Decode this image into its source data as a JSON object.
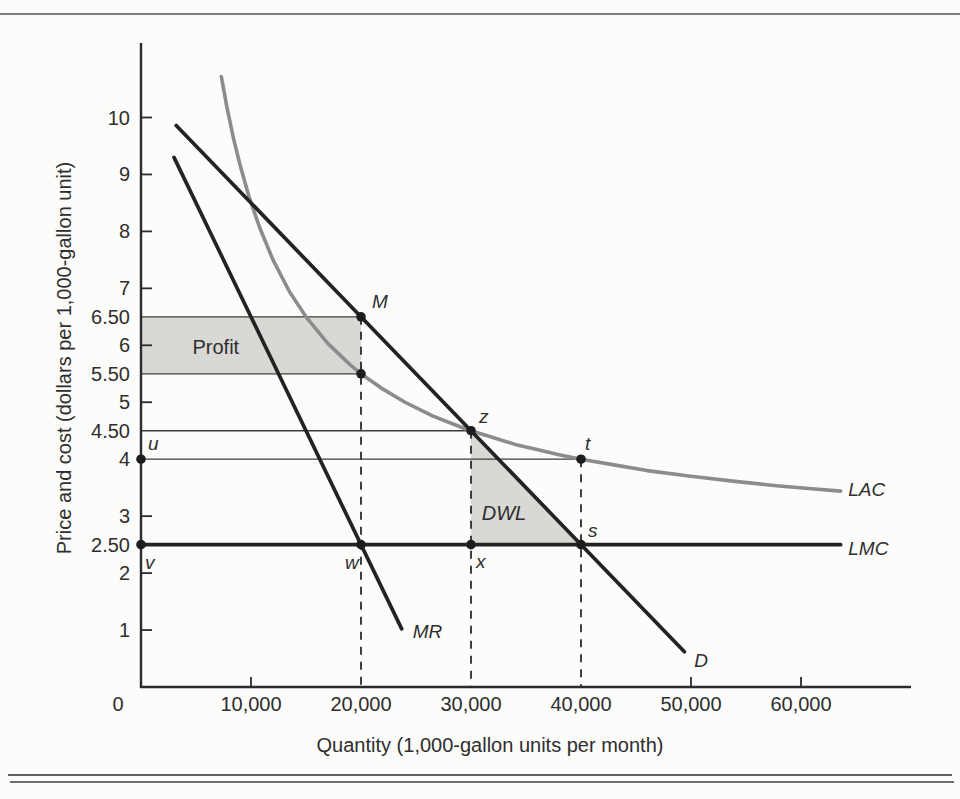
{
  "figure": {
    "description": "Monopoly profit and deadweight loss diagram"
  },
  "chart_data": {
    "type": "line",
    "title": "",
    "xlabel": "Quantity (1,000-gallon units per month)",
    "ylabel": "Price and cost (dollars per 1,000-gallon unit)",
    "xlim": [
      0,
      70000
    ],
    "ylim": [
      0,
      11.3
    ],
    "grid": false,
    "colors": {
      "ink": "#232323",
      "lac_gray": "#8c8c8c",
      "shade": "#d8d8d4",
      "thin_line": "#3c3c3c",
      "text": "#2e2e2e"
    },
    "x_ticks": [
      {
        "value": 0,
        "label": "0",
        "mark": false,
        "dx": -23
      },
      {
        "value": 10000,
        "label": "10,000",
        "mark": true,
        "dx": 0
      },
      {
        "value": 20000,
        "label": "20,000",
        "mark": false,
        "dx": 0
      },
      {
        "value": 30000,
        "label": "30,000",
        "mark": false,
        "dx": 0
      },
      {
        "value": 40000,
        "label": "40,000",
        "mark": false,
        "dx": 0
      },
      {
        "value": 50000,
        "label": "50,000",
        "mark": true,
        "dx": 0
      },
      {
        "value": 60000,
        "label": "60,000",
        "mark": true,
        "dx": 0
      }
    ],
    "y_ticks": [
      {
        "value": 10,
        "label": "10",
        "mark": true
      },
      {
        "value": 9,
        "label": "9",
        "mark": true
      },
      {
        "value": 8,
        "label": "8",
        "mark": true
      },
      {
        "value": 7,
        "label": "7",
        "mark": true
      },
      {
        "value": 6.5,
        "label": "6.50",
        "mark": false
      },
      {
        "value": 6,
        "label": "6",
        "mark": true
      },
      {
        "value": 5.5,
        "label": "5.50",
        "mark": false
      },
      {
        "value": 5,
        "label": "5",
        "mark": true
      },
      {
        "value": 4.5,
        "label": "4.50",
        "mark": false
      },
      {
        "value": 4,
        "label": "4",
        "mark": false
      },
      {
        "value": 3,
        "label": "3",
        "mark": true
      },
      {
        "value": 2.5,
        "label": "2.50",
        "mark": false
      },
      {
        "value": 2,
        "label": "2",
        "mark": true
      },
      {
        "value": 1,
        "label": "1",
        "mark": true
      }
    ],
    "reference_lines": [
      {
        "p": 6.5,
        "q_to": 20000
      },
      {
        "p": 5.5,
        "q_to": 20000
      },
      {
        "p": 4.5,
        "q_to": 30000
      },
      {
        "p": 4.0,
        "q_to": 40000
      }
    ],
    "dashed_verticals": [
      {
        "q": 20000,
        "p_from": 6.5
      },
      {
        "q": 30000,
        "p_from": 4.5
      },
      {
        "q": 40000,
        "p_from": 4.0
      }
    ],
    "regions": [
      {
        "name": "profit-region",
        "label": "Profit",
        "italic": false,
        "vertices": [
          [
            0,
            6.5
          ],
          [
            20000,
            6.5
          ],
          [
            20000,
            5.5
          ],
          [
            0,
            5.5
          ]
        ],
        "label_at": [
          6800,
          5.97
        ]
      },
      {
        "name": "dwl-region",
        "label": "DWL",
        "italic": true,
        "vertices": [
          [
            30000,
            4.5
          ],
          [
            30000,
            2.5
          ],
          [
            40000,
            2.5
          ]
        ],
        "label_at": [
          33000,
          3.06
        ]
      }
    ],
    "series": [
      {
        "name": "long-run-average-cost",
        "label": "LAC",
        "color": "lac_gray",
        "width": 3.6,
        "points": [
          [
            7300,
            10.72
          ],
          [
            7800,
            10.19
          ],
          [
            8400,
            9.64
          ],
          [
            9000,
            9.17
          ],
          [
            9800,
            8.62
          ],
          [
            10800,
            8.06
          ],
          [
            12000,
            7.5
          ],
          [
            13500,
            6.94
          ],
          [
            15000,
            6.5
          ],
          [
            17000,
            6.03
          ],
          [
            19000,
            5.66
          ],
          [
            20000,
            5.5
          ],
          [
            22000,
            5.23
          ],
          [
            24000,
            5.0
          ],
          [
            26500,
            4.76
          ],
          [
            29000,
            4.57
          ],
          [
            30000,
            4.5
          ],
          [
            32000,
            4.38
          ],
          [
            34000,
            4.26
          ],
          [
            36000,
            4.17
          ],
          [
            38000,
            4.08
          ],
          [
            40000,
            4.0
          ],
          [
            43000,
            3.9
          ],
          [
            46000,
            3.8
          ],
          [
            50000,
            3.7
          ],
          [
            54000,
            3.61
          ],
          [
            58000,
            3.53
          ],
          [
            61000,
            3.48
          ],
          [
            63600,
            3.44
          ]
        ],
        "label_at": [
          64300,
          3.47
        ]
      },
      {
        "name": "demand",
        "label": "D",
        "color": "ink",
        "width": 3.7,
        "points": [
          [
            3200,
            9.86
          ],
          [
            49400,
            0.62
          ]
        ],
        "label_at": [
          50300,
          0.47
        ]
      },
      {
        "name": "marginal-revenue",
        "label": "MR",
        "color": "ink",
        "width": 3.7,
        "points": [
          [
            3000,
            9.3
          ],
          [
            23700,
            1.02
          ]
        ],
        "label_at": [
          24700,
          0.97
        ]
      },
      {
        "name": "long-run-marginal-cost",
        "label": "LMC",
        "color": "ink",
        "width": 3.8,
        "points": [
          [
            0,
            2.5
          ],
          [
            63600,
            2.5
          ]
        ],
        "label_at": [
          64300,
          2.44
        ]
      }
    ],
    "points": [
      {
        "id": "M",
        "q": 20000,
        "p": 6.5,
        "label": "M",
        "dx": 11,
        "dy": -9
      },
      {
        "id": "lac-at-20000",
        "q": 20000,
        "p": 5.5,
        "label": "",
        "dx": 0,
        "dy": 0
      },
      {
        "id": "z",
        "q": 30000,
        "p": 4.5,
        "label": "z",
        "dx": 8,
        "dy": -8
      },
      {
        "id": "t",
        "q": 40000,
        "p": 4.0,
        "label": "t",
        "dx": 4,
        "dy": -9
      },
      {
        "id": "s",
        "q": 40000,
        "p": 2.5,
        "label": "s",
        "dx": 7,
        "dy": -8
      },
      {
        "id": "u",
        "q": 0,
        "p": 4.0,
        "label": "u",
        "dx": 7,
        "dy": -9
      },
      {
        "id": "v",
        "q": 0,
        "p": 2.5,
        "label": "v",
        "dx": 4,
        "dy": 24
      },
      {
        "id": "w",
        "q": 20000,
        "p": 2.5,
        "label": "w",
        "dx": -16,
        "dy": 24
      },
      {
        "id": "x",
        "q": 30000,
        "p": 2.5,
        "label": "x",
        "dx": 5,
        "dy": 23
      }
    ]
  }
}
